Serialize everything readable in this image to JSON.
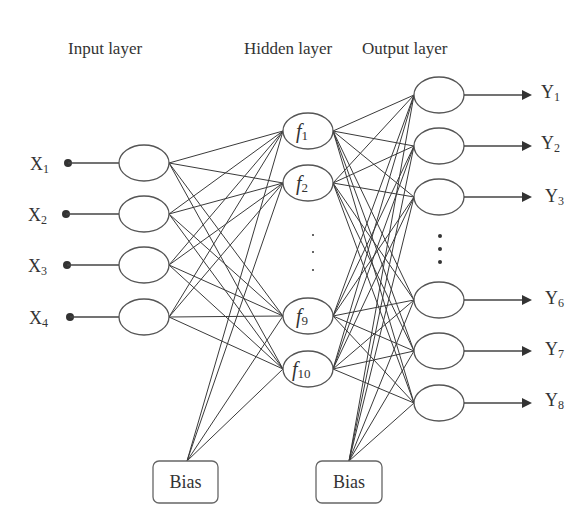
{
  "titles": {
    "input": "Input layer",
    "hidden": "Hidden layer",
    "output": "Output layer"
  },
  "inputs": [
    {
      "base": "X",
      "sub": "1"
    },
    {
      "base": "X",
      "sub": "2"
    },
    {
      "base": "X",
      "sub": "3"
    },
    {
      "base": "X",
      "sub": "4"
    }
  ],
  "hidden": [
    {
      "base": "f",
      "sub": "1"
    },
    {
      "base": "f",
      "sub": "2"
    },
    {
      "base": "f",
      "sub": "9"
    },
    {
      "base": "f",
      "sub": "10"
    }
  ],
  "outputs": [
    {
      "base": "Y",
      "sub": "1"
    },
    {
      "base": "Y",
      "sub": "2"
    },
    {
      "base": "Y",
      "sub": "3"
    },
    {
      "base": "Y",
      "sub": "6"
    },
    {
      "base": "Y",
      "sub": "7"
    },
    {
      "base": "Y",
      "sub": "8"
    }
  ],
  "bias": {
    "hidden_bias_label": "Bias",
    "output_bias_label": "Bias"
  },
  "ellipsis": {
    "hidden": "⋮",
    "output": "⋮"
  },
  "colors": {
    "line": "#3a3a3a",
    "node_stroke": "#555555",
    "text": "#333333",
    "background": "#ffffff"
  }
}
